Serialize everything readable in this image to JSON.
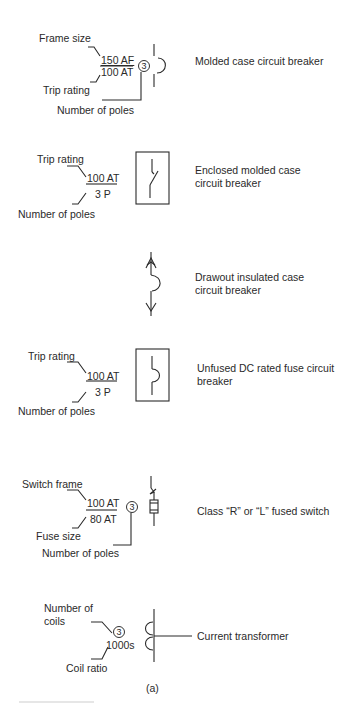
{
  "figure": {
    "caption": "(a)",
    "symbols": [
      {
        "name": "molded-case-circuit-breaker",
        "description": "Molded case circuit breaker",
        "labels": {
          "frame_size": "Frame size",
          "trip_rating": "Trip rating",
          "poles": "Number of poles"
        },
        "values": {
          "numerator": "150 AF",
          "denominator": "100 AT",
          "poles": "3"
        }
      },
      {
        "name": "enclosed-molded-case-circuit-breaker",
        "description": "Enclosed molded case circuit breaker",
        "labels": {
          "trip_rating": "Trip rating",
          "poles": "Number of poles"
        },
        "values": {
          "numerator": "100 AT",
          "denominator": "3 P"
        }
      },
      {
        "name": "drawout-insulated-case-circuit-breaker",
        "description": "Drawout insulated case circuit breaker"
      },
      {
        "name": "unfused-dc-rated-fuse-circuit-breaker",
        "description": "Unfused DC rated fuse circuit breaker",
        "labels": {
          "trip_rating": "Trip rating",
          "poles": "Number of poles"
        },
        "values": {
          "numerator": "100 AT",
          "denominator": "3 P"
        }
      },
      {
        "name": "class-r-or-l-fused-switch",
        "description": "Class “R” or “L” fused switch",
        "labels": {
          "switch_frame": "Switch frame",
          "fuse_size": "Fuse size",
          "poles": "Number of poles"
        },
        "values": {
          "numerator": "100 AT",
          "denominator": "80 AT",
          "poles": "3"
        }
      },
      {
        "name": "current-transformer",
        "description": "Current transformer",
        "labels": {
          "coils": "Number of coils",
          "coil_ratio": "Coil ratio"
        },
        "values": {
          "coils": "3",
          "ratio": "1000s"
        }
      }
    ]
  },
  "colors": {
    "ink": "#2a2a2a",
    "background": "#ffffff"
  }
}
